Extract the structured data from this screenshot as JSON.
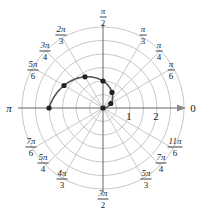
{
  "chart_data": {
    "type": "scatter",
    "subtype": "polar",
    "title": "",
    "equation_description": "Polar curve r = 2θ/π for 0 ≤ θ ≤ π with plotted points",
    "points": [
      {
        "theta_label": "0",
        "theta": 0,
        "r": 0
      },
      {
        "theta_label": "π/6",
        "theta": 0.5236,
        "r": 0.333
      },
      {
        "theta_label": "π/3",
        "theta": 1.0472,
        "r": 0.667
      },
      {
        "theta_label": "π/2",
        "theta": 1.5708,
        "r": 1.0
      },
      {
        "theta_label": "2π/3",
        "theta": 2.0944,
        "r": 1.333
      },
      {
        "theta_label": "5π/6",
        "theta": 2.618,
        "r": 1.667
      },
      {
        "theta_label": "π",
        "theta": 3.1416,
        "r": 2.0
      }
    ],
    "radial_rings": [
      0.5,
      1,
      1.5,
      2,
      2.5,
      3
    ],
    "radial_tick_labels": [
      "1",
      "2"
    ],
    "angle_labels": [
      {
        "label": "0",
        "num": "0",
        "den": ""
      },
      {
        "label": "π/6",
        "num": "π",
        "den": "6"
      },
      {
        "label": "π/4",
        "num": "π",
        "den": "4"
      },
      {
        "label": "π/3",
        "num": "π",
        "den": "3"
      },
      {
        "label": "π/2",
        "num": "π",
        "den": "2"
      },
      {
        "label": "2π/3",
        "num": "2π",
        "den": "3"
      },
      {
        "label": "3π/4",
        "num": "3π",
        "den": "4"
      },
      {
        "label": "5π/6",
        "num": "5π",
        "den": "6"
      },
      {
        "label": "π",
        "num": "π",
        "den": ""
      },
      {
        "label": "7π/6",
        "num": "7π",
        "den": "6"
      },
      {
        "label": "5π/4",
        "num": "5π",
        "den": "4"
      },
      {
        "label": "4π/3",
        "num": "4π",
        "den": "3"
      },
      {
        "label": "3π/2",
        "num": "3π",
        "den": "2"
      },
      {
        "label": "5π/3",
        "num": "5π",
        "den": "3"
      },
      {
        "label": "7π/4",
        "num": "7π",
        "den": "4"
      },
      {
        "label": "11π/6",
        "num": "11π",
        "den": "6"
      }
    ],
    "grid": true,
    "colors": {
      "grid": "#c8c8c8",
      "curve": "#555555",
      "point": "#222222",
      "axis": "#666666"
    }
  },
  "labels": {
    "zero": "0",
    "pi": "π",
    "r1": "1",
    "r2": "2",
    "pi_6_num": "π",
    "pi_6_den": "6",
    "pi_4_num": "π",
    "pi_4_den": "4",
    "pi_3_num": "π",
    "pi_3_den": "3",
    "pi_2_num": "π",
    "pi_2_den": "2",
    "2pi_3_num": "2π",
    "2pi_3_den": "3",
    "3pi_4_num": "3π",
    "3pi_4_den": "4",
    "5pi_6_num": "5π",
    "5pi_6_den": "6",
    "7pi_6_num": "7π",
    "7pi_6_den": "6",
    "5pi_4_num": "5π",
    "5pi_4_den": "4",
    "4pi_3_num": "4π",
    "4pi_3_den": "3",
    "3pi_2_num": "3π",
    "3pi_2_den": "2",
    "5pi_3_num": "5π",
    "5pi_3_den": "3",
    "7pi_4_num": "7π",
    "7pi_4_den": "4",
    "11pi_6_num": "11π",
    "11pi_6_den": "6"
  }
}
